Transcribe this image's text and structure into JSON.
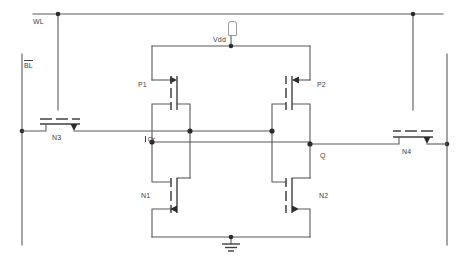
{
  "diagram": {
    "type": "circuit-schematic",
    "background_color": "#ffffff",
    "wire_color": "#58595b",
    "device_color": "#3f4042",
    "label_color": "#414042"
  },
  "labels": {
    "word_line": "WL",
    "bit_line_bar": "BL",
    "bit_line_bar_overline": true,
    "supply": "Vdd",
    "node_q_bar": "Q",
    "node_q_bar_overline": true,
    "node_q": "Q",
    "pmos_left": "P1",
    "pmos_right": "P2",
    "nmos_left": "N1",
    "nmos_right": "N2",
    "access_left": "N3",
    "access_right": "N4"
  },
  "transistors": [
    {
      "name": "P1",
      "type": "pmos",
      "role": "pull-up-left",
      "gate_net": "Q",
      "drain_net": "Q_bar",
      "source_net": "Vdd"
    },
    {
      "name": "P2",
      "type": "pmos",
      "role": "pull-up-right",
      "gate_net": "Q_bar",
      "drain_net": "Q",
      "source_net": "Vdd"
    },
    {
      "name": "N1",
      "type": "nmos",
      "role": "pull-down-left",
      "gate_net": "Q",
      "drain_net": "Q_bar",
      "source_net": "GND"
    },
    {
      "name": "N2",
      "type": "nmos",
      "role": "pull-down-right",
      "gate_net": "Q_bar",
      "drain_net": "Q",
      "source_net": "GND"
    },
    {
      "name": "N3",
      "type": "nmos",
      "role": "access-left",
      "gate_net": "WL",
      "drain_net": "BL_bar",
      "source_net": "Q_bar"
    },
    {
      "name": "N4",
      "type": "nmos",
      "role": "access-right",
      "gate_net": "WL",
      "drain_net": "BL",
      "source_net": "Q"
    }
  ],
  "nets": [
    {
      "name": "WL",
      "description": "word line, horizontal rail across top"
    },
    {
      "name": "BL_bar",
      "description": "complement bit line, vertical rail at left"
    },
    {
      "name": "BL",
      "description": "bit line, vertical rail at right"
    },
    {
      "name": "Vdd",
      "description": "supply rail feeding sources of P1 and P2"
    },
    {
      "name": "Q_bar",
      "description": "storage node, left inverter output"
    },
    {
      "name": "Q",
      "description": "storage node, right inverter output"
    },
    {
      "name": "GND",
      "description": "ground, sources of N1 and N2"
    }
  ],
  "symbols": {
    "ground": "ground-symbol",
    "vdd_flag": "vdd-terminal-flag",
    "junction": "junction-dot"
  }
}
